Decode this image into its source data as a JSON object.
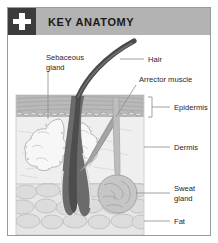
{
  "panel": {
    "width": 218,
    "height": 243,
    "background": "#ffffff",
    "border_color": "#9a9a9a"
  },
  "header": {
    "title": "KEY ANATOMY",
    "bar_color": "#b3b3b3",
    "badge_color": "#3b3b3b",
    "badge_icon": "medical-cross-icon",
    "badge_icon_color": "#ffffff",
    "title_color": "#1a1a1a"
  },
  "figure": {
    "leader_line_color": "#8c8c8c",
    "label_color": "#262626",
    "layers": [
      {
        "name": "Epidermis",
        "fill": "#bdbdbd"
      },
      {
        "name": "Dermis",
        "fill": "#e9e9e9"
      },
      {
        "name": "Fat",
        "fill": "#e3e3e3"
      }
    ],
    "structures": [
      {
        "name": "Hair",
        "fill": "#5a5a5a"
      },
      {
        "name": "Sebaceous gland",
        "fill": "#f2f2f2"
      },
      {
        "name": "Arrector muscle",
        "fill": "#a8a8a8"
      },
      {
        "name": "Sweat gland",
        "fill": "#b9b9b9"
      },
      {
        "name": "Hair follicle",
        "fill": "#6e6e6e"
      }
    ],
    "labels": [
      {
        "id": "sebaceous-gland",
        "line1": "Sebaceous",
        "line2": "gland"
      },
      {
        "id": "hair",
        "line1": "Hair",
        "line2": ""
      },
      {
        "id": "arrector-muscle",
        "line1": "Arrector muscle",
        "line2": ""
      },
      {
        "id": "epidermis",
        "line1": "Epidermis",
        "line2": ""
      },
      {
        "id": "dermis",
        "line1": "Dermis",
        "line2": ""
      },
      {
        "id": "sweat-gland",
        "line1": "Sweat",
        "line2": "gland"
      },
      {
        "id": "fat",
        "line1": "Fat",
        "line2": ""
      }
    ]
  }
}
